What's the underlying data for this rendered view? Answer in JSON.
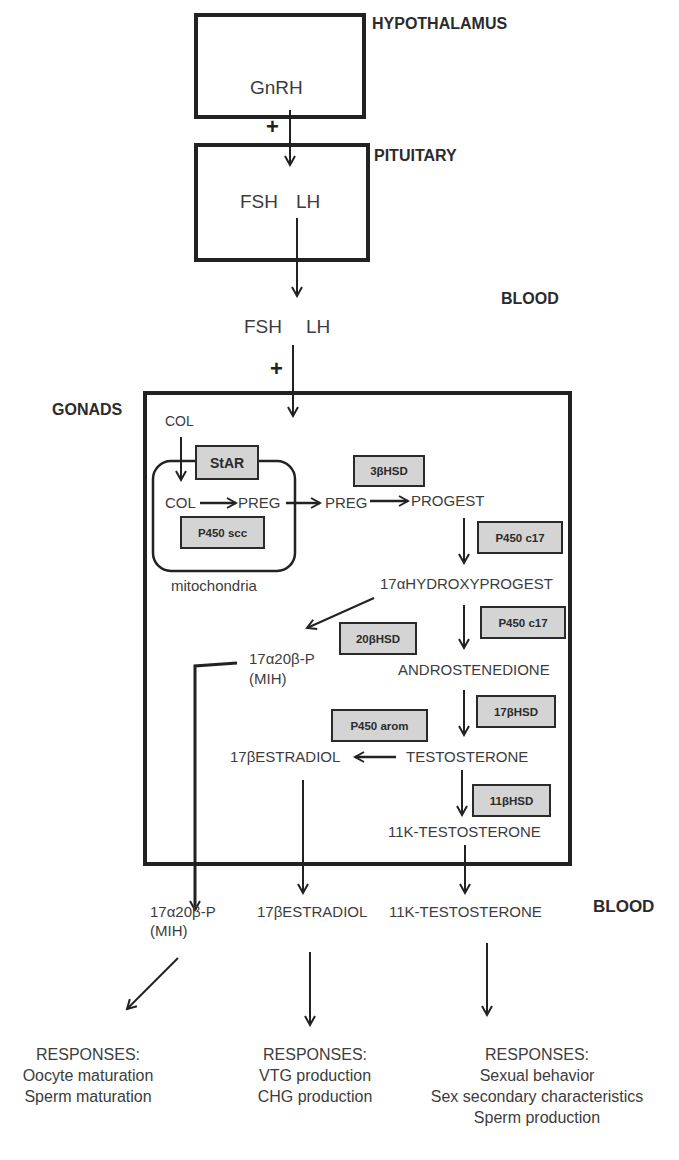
{
  "labels": {
    "hypothalamus": "HYPOTHALAMUS",
    "pituitary": "PITUITARY",
    "blood_top": "BLOOD",
    "gonads": "GONADS",
    "blood_bottom": "BLOOD",
    "plus": "+"
  },
  "hypothalamus": {
    "hormone": "GnRH"
  },
  "pituitary": {
    "fsh": "FSH",
    "lh": "LH"
  },
  "blood_hormones": {
    "fsh": "FSH",
    "lh": "LH"
  },
  "gonads": {
    "col_outer": "COL",
    "col_inner": "COL",
    "preg_inner": "PREG",
    "preg_outer": "PREG",
    "progest": "PROGEST",
    "hydroxyprogest": "17αHYDROXYPROGEST",
    "mih_line1": "17α20β-P",
    "mih_line2": "(MIH)",
    "androstenedione": "ANDROSTENEDIONE",
    "testosterone": "TESTOSTERONE",
    "estradiol": "17βESTRADIOL",
    "k_testosterone": "11K-TESTOSTERONE",
    "mitochondria": "mitochondria",
    "enzymes": {
      "star": "StAR",
      "p450scc": "P450 scc",
      "hsd3b": "3βHSD",
      "p450c17_a": "P450 c17",
      "p450c17_b": "P450 c17",
      "hsd20b": "20βHSD",
      "hsd17b": "17βHSD",
      "p450arom": "P450 arom",
      "hsd11b": "11βHSD"
    }
  },
  "blood_outputs": {
    "mih_line1": "17α20β-P",
    "mih_line2": "(MIH)",
    "estradiol": "17βESTRADIOL",
    "k_testosterone": "11K-TESTOSTERONE"
  },
  "responses": [
    {
      "title": "RESPONSES:",
      "items": [
        "Oocyte maturation",
        "Sperm maturation"
      ]
    },
    {
      "title": "RESPONSES:",
      "items": [
        "VTG production",
        "CHG production"
      ]
    },
    {
      "title": "RESPONSES:",
      "items": [
        "Sexual behavior",
        "Sex secondary characteristics",
        "Sperm production"
      ]
    }
  ],
  "colors": {
    "line": "#222222",
    "enzyme_fill": "#d4d4d4",
    "text": "#3c3c3c"
  }
}
